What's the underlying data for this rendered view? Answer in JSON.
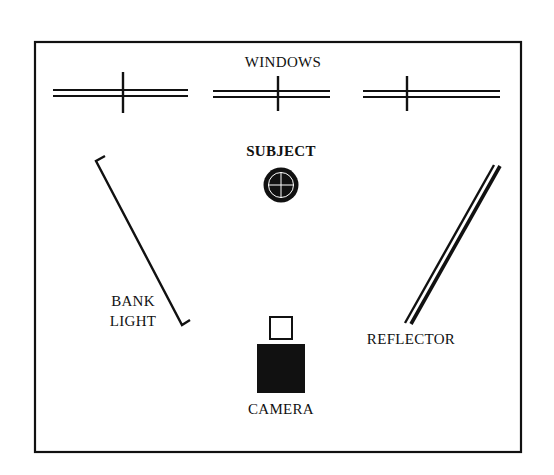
{
  "diagram": {
    "type": "lighting-setup-floor-plan",
    "labels": {
      "windows": "WINDOWS",
      "subject": "SUBJECT",
      "bank_light_line1": "BANK",
      "bank_light_line2": "LIGHT",
      "reflector": "REFLECTOR",
      "camera": "CAMERA"
    },
    "elements": [
      {
        "id": "windows",
        "label": "WINDOWS",
        "count": 3,
        "position": "top wall"
      },
      {
        "id": "subject",
        "label": "SUBJECT",
        "shape": "circle with crosshair",
        "position": "center"
      },
      {
        "id": "bank-light",
        "label": "BANK LIGHT",
        "shape": "angled bracket line",
        "position": "left"
      },
      {
        "id": "reflector",
        "label": "REFLECTOR",
        "shape": "angled double line",
        "position": "right"
      },
      {
        "id": "camera",
        "label": "CAMERA",
        "shape": "filled square with viewfinder",
        "position": "bottom center"
      }
    ],
    "colors": {
      "ink": "#111111",
      "background": "#ffffff"
    }
  }
}
